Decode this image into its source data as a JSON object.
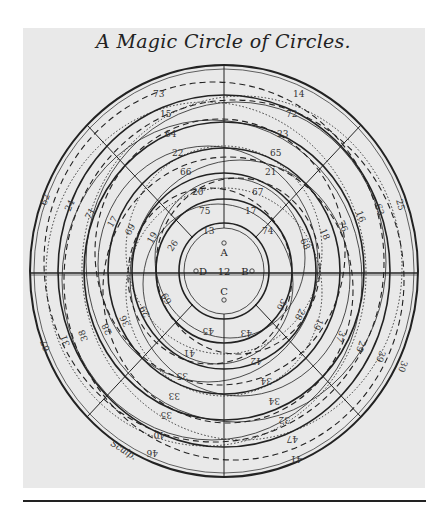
{
  "title": "A Magic Circle of Circles.",
  "center": {
    "value": "12",
    "points": [
      "A",
      "B",
      "C",
      "D"
    ]
  },
  "signature": "Sculp.",
  "ring_labels": {
    "top_left": [
      "73",
      "15",
      "64",
      "22",
      "66",
      "20",
      "75",
      "13"
    ],
    "top_right": [
      "14",
      "72",
      "23",
      "65",
      "21",
      "67",
      "17",
      "74"
    ],
    "left": [
      "62",
      "24",
      "71",
      "17",
      "69",
      "19",
      "26"
    ],
    "right": [
      "25",
      "63",
      "16",
      "76",
      "18",
      "68"
    ],
    "lower_left": [
      "67",
      "31",
      "38",
      "28",
      "36",
      "29",
      "69"
    ],
    "lower_right": [
      "30",
      "39",
      "29",
      "37",
      "19",
      "28",
      "36"
    ],
    "bottom_left": [
      "46",
      "40",
      "35",
      "33",
      "35",
      "41",
      "45"
    ],
    "bottom_right": [
      "41",
      "47",
      "32",
      "34",
      "34",
      "42",
      "43"
    ]
  },
  "colors": {
    "ink": "#222222",
    "paper": "#e9e9e9"
  }
}
